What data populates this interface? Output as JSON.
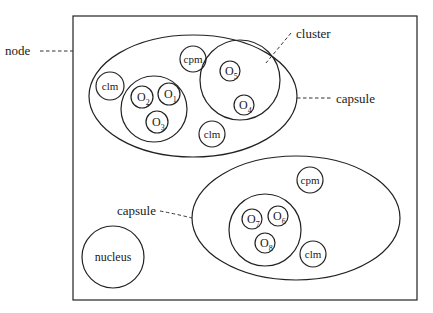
{
  "diagram": {
    "type": "structure",
    "node": {
      "label": "node"
    },
    "capsules": [
      {
        "label": "capsule",
        "clusters": [
          {
            "objects": [
              {
                "name": "O",
                "sub": "2"
              },
              {
                "name": "O",
                "sub": "1"
              },
              {
                "name": "O",
                "sub": "3"
              }
            ]
          },
          {
            "label": "cluster",
            "objects": [
              {
                "name": "O",
                "sub": "5"
              },
              {
                "name": "O",
                "sub": "4"
              }
            ]
          }
        ],
        "components": [
          "clm",
          "cpm",
          "clm"
        ]
      },
      {
        "label": "capsule",
        "clusters": [
          {
            "objects": [
              {
                "name": "O",
                "sub": "7"
              },
              {
                "name": "O",
                "sub": "6"
              },
              {
                "name": "O",
                "sub": "8"
              }
            ]
          }
        ],
        "components": [
          "cpm",
          "clm"
        ]
      }
    ],
    "nucleus": {
      "label": "nucleus"
    }
  },
  "labels": {
    "node": "node",
    "cluster": "cluster",
    "capsule_upper": "capsule",
    "capsule_lower": "capsule",
    "nucleus": "nucleus",
    "clm": "clm",
    "cpm": "cpm",
    "O": "O",
    "s1": "1",
    "s2": "2",
    "s3": "3",
    "s4": "4",
    "s5": "5",
    "s6": "6",
    "s7": "7",
    "s8": "8"
  }
}
